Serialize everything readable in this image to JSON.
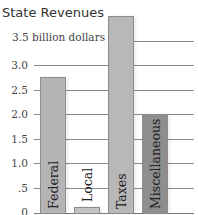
{
  "chart_data": {
    "type": "bar",
    "title": "State Revenues",
    "ylabel": "billion dollars",
    "xlabel": "",
    "categories": [
      "Federal",
      "Local",
      "Taxes",
      "Miscellaneous"
    ],
    "values": [
      2.75,
      0.1,
      4.0,
      2.0
    ],
    "ylim": [
      0,
      3.5
    ],
    "yticks": [
      0,
      0.5,
      1.0,
      1.5,
      2.0,
      2.5,
      3.0,
      3.5
    ],
    "ytick_labels": [
      "0",
      ".5",
      "1.0",
      "1.5",
      "2.0",
      "2.5",
      "3.0",
      "3.5 billion dollars"
    ],
    "grid": true,
    "legend": null,
    "colors": [
      "#b4b4b4",
      "#c4c4c4",
      "#b8b8b8",
      "#8e8e8e"
    ]
  },
  "labels": {
    "title": "State Revenues",
    "unit_tick": "3.5 billion dollars",
    "ticks": [
      "3.0",
      "2.5",
      "2.0",
      "1.5",
      "1.0",
      ".5",
      "0"
    ]
  }
}
